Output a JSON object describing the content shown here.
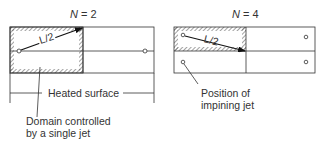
{
  "left_panel": {
    "title_var": "N",
    "title_eq": " = 2",
    "arrow_label": "L/2",
    "dimension_label": "Heated surface",
    "callout_line1": "Domain controlled",
    "callout_line2": "by a single jet"
  },
  "right_panel": {
    "title_var": "N",
    "title_eq": " = 4",
    "arrow_label": "L/2",
    "callout_line1": "Position of",
    "callout_line2": "impining jet"
  },
  "colors": {
    "line": "#333333",
    "hatch": "#444444",
    "background": "#ffffff"
  }
}
